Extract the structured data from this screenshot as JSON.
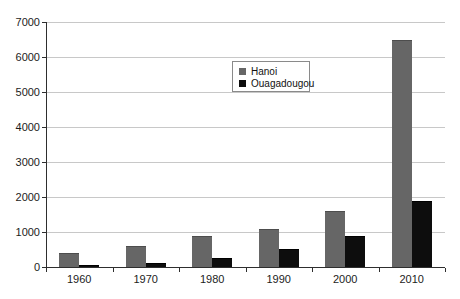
{
  "chart_data": {
    "type": "bar",
    "title": "",
    "xlabel": "",
    "ylabel": "",
    "categories": [
      "1960",
      "1970",
      "1980",
      "1990",
      "2000",
      "2010"
    ],
    "series": [
      {
        "name": "Hanoi",
        "color": "#666666",
        "border_color": "#4d4d4d",
        "values": [
          400,
          600,
          900,
          1100,
          1600,
          6500
        ]
      },
      {
        "name": "Ouagadougou",
        "color": "#0d0d0d",
        "border_color": "#000000",
        "values": [
          60,
          110,
          250,
          520,
          900,
          1900
        ]
      }
    ],
    "ylim": [
      0,
      7000
    ],
    "ytick_step": 1000,
    "ytick_labels": [
      "0",
      "1000",
      "2000",
      "3000",
      "4000",
      "5000",
      "6000",
      "7000"
    ],
    "grid": true,
    "legend_position": "top-center"
  },
  "colors": {
    "background": "#ffffff",
    "gridline": "#c8c8c8",
    "axis": "#2e2e2e",
    "text": "#1c1c1c",
    "legend_border": "#8a8a8a"
  }
}
